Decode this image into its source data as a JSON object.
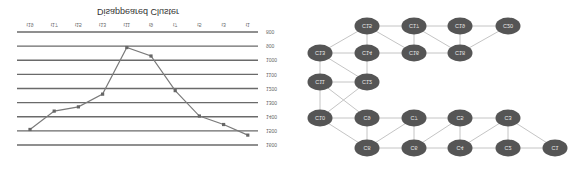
{
  "chart_data": {
    "type": "line",
    "title": "Disappeared Cluster",
    "xlabel": "",
    "ylabel": "",
    "categories": [
      "t19",
      "t17",
      "t15",
      "t13",
      "t11",
      "t9",
      "t7",
      "t5",
      "t3",
      "t1"
    ],
    "series": [
      {
        "name": "Disappeared Cluster",
        "values": [
          1490,
          1360,
          1330,
          1240,
          910,
          970,
          1215,
          1395,
          1455,
          1530
        ]
      }
    ],
    "yticks": [
      800,
      900,
      1000,
      1100,
      1200,
      1300,
      1400,
      1500,
      1600
    ],
    "ylim": [
      800,
      1600
    ],
    "grid": true,
    "legend": "none",
    "orientation_note": "image rendered vertically flipped"
  },
  "diagram": {
    "nodes": [
      {
        "id": "C15",
        "label": "C15"
      },
      {
        "id": "C17",
        "label": "C17"
      },
      {
        "id": "C19",
        "label": "C19"
      },
      {
        "id": "C20",
        "label": "C20"
      },
      {
        "id": "C13",
        "label": "C13"
      },
      {
        "id": "C14",
        "label": "C14"
      },
      {
        "id": "C16",
        "label": "C16"
      },
      {
        "id": "C18",
        "label": "C18"
      },
      {
        "id": "C11",
        "label": "C11"
      },
      {
        "id": "C12",
        "label": "C12"
      },
      {
        "id": "C10",
        "label": "C10"
      },
      {
        "id": "C9",
        "label": "C9"
      },
      {
        "id": "C7",
        "label": "C7"
      },
      {
        "id": "C5",
        "label": "C5"
      },
      {
        "id": "C3",
        "label": "C3"
      },
      {
        "id": "C8",
        "label": "C8"
      },
      {
        "id": "C6",
        "label": "C6"
      },
      {
        "id": "C4",
        "label": "C4"
      },
      {
        "id": "C2",
        "label": "C2"
      },
      {
        "id": "C1",
        "label": "C1"
      }
    ],
    "edges": [
      [
        "C13",
        "C15"
      ],
      [
        "C13",
        "C14"
      ],
      [
        "C13",
        "C12"
      ],
      [
        "C13",
        "C11"
      ],
      [
        "C15",
        "C14"
      ],
      [
        "C15",
        "C17"
      ],
      [
        "C15",
        "C16"
      ],
      [
        "C17",
        "C16"
      ],
      [
        "C17",
        "C19"
      ],
      [
        "C17",
        "C18"
      ],
      [
        "C19",
        "C18"
      ],
      [
        "C19",
        "C20"
      ],
      [
        "C18",
        "C20"
      ],
      [
        "C14",
        "C16"
      ],
      [
        "C16",
        "C18"
      ],
      [
        "C14",
        "C12"
      ],
      [
        "C11",
        "C12"
      ],
      [
        "C11",
        "C10"
      ],
      [
        "C11",
        "C9"
      ],
      [
        "C12",
        "C10"
      ],
      [
        "C10",
        "C9"
      ],
      [
        "C10",
        "C8"
      ],
      [
        "C9",
        "C8"
      ],
      [
        "C9",
        "C7"
      ],
      [
        "C8",
        "C6"
      ],
      [
        "C8",
        "C7"
      ],
      [
        "C7",
        "C6"
      ],
      [
        "C7",
        "C5"
      ],
      [
        "C6",
        "C5"
      ],
      [
        "C6",
        "C4"
      ],
      [
        "C5",
        "C4"
      ],
      [
        "C5",
        "C3"
      ],
      [
        "C4",
        "C3"
      ],
      [
        "C4",
        "C2"
      ],
      [
        "C3",
        "C2"
      ],
      [
        "C3",
        "C1"
      ],
      [
        "C2",
        "C1"
      ]
    ]
  }
}
